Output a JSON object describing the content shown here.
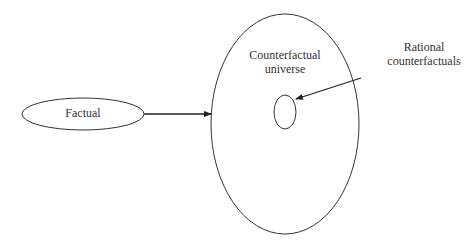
{
  "diagram": {
    "nodes": {
      "factual": {
        "label": "Factual"
      },
      "universe": {
        "label_line1": "Counterfactual",
        "label_line2": "universe"
      },
      "rational": {
        "label_line1": "Rational",
        "label_line2": "counterfactuals"
      }
    },
    "edges": [
      {
        "from": "Factual",
        "to": "Counterfactual universe"
      },
      {
        "from": "Rational counterfactuals",
        "to": "inner subset ellipse"
      }
    ],
    "colors": {
      "stroke": "#333333",
      "background": "#ffffff"
    }
  }
}
